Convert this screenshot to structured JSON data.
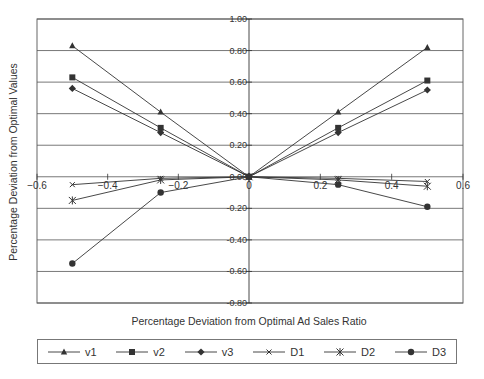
{
  "chart_data": {
    "type": "line",
    "title": "",
    "xlabel": "Percentage Deviation from Optimal Ad Sales Ratio",
    "ylabel": "Percentage Deviation from Optimal Values",
    "xlim": [
      -0.6,
      0.6
    ],
    "ylim": [
      -0.8,
      1.0
    ],
    "x_ticks": [
      "-0.6",
      "-0.4",
      "-0.2",
      "0",
      "0.2",
      "0.4",
      "0.6"
    ],
    "y_ticks": [
      "1.00",
      "0.80",
      "0.60",
      "0.40",
      "0.20",
      "0.00",
      "-0.20",
      "-0.40",
      "-0.60",
      "-0.80"
    ],
    "grid": "horizontal",
    "legend_position": "bottom",
    "x": [
      -0.5,
      -0.25,
      0,
      0.25,
      0.5
    ],
    "series": [
      {
        "name": "v1",
        "marker": "triangle",
        "values": [
          0.83,
          0.41,
          0.0,
          0.41,
          0.82
        ]
      },
      {
        "name": "v2",
        "marker": "square",
        "values": [
          0.63,
          0.31,
          0.0,
          0.31,
          0.61
        ]
      },
      {
        "name": "v3",
        "marker": "diamond",
        "values": [
          0.56,
          0.28,
          0.0,
          0.28,
          0.55
        ]
      },
      {
        "name": "D1",
        "marker": "x",
        "values": [
          -0.05,
          -0.01,
          0.0,
          -0.01,
          -0.03
        ]
      },
      {
        "name": "D2",
        "marker": "star",
        "values": [
          -0.15,
          -0.02,
          0.0,
          -0.02,
          -0.06
        ]
      },
      {
        "name": "D3",
        "marker": "circle",
        "values": [
          -0.55,
          -0.1,
          0.0,
          -0.05,
          -0.19
        ]
      }
    ]
  },
  "colors": {
    "line": "#333333",
    "grid": "#555555",
    "border": "#666666"
  }
}
